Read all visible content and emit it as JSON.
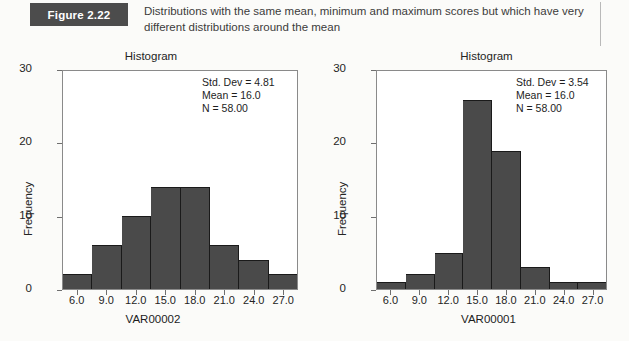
{
  "figure": {
    "badge": "Figure 2.22",
    "caption": "Distributions with the same mean, minimum and maximum scores but which have very different distributions around the mean"
  },
  "colors": {
    "bar_fill": "#4a4a4a",
    "bar_outline": "#1a1a1a",
    "badge_background": "#4c4c4c",
    "axis": "#8a8a8a",
    "page_background": "#fbfbf9"
  },
  "charts": [
    {
      "panel": "left",
      "title": "Histogram",
      "stats": {
        "std_dev": "Std. Dev = 4.81",
        "mean": "Mean = 16.0",
        "n": "N = 58.00"
      },
      "y_ticks": [
        "0",
        "10",
        "20",
        "30"
      ],
      "x_ticks": [
        "6.0",
        "9.0",
        "12.0",
        "15.0",
        "18.0",
        "21.0",
        "24.0",
        "27.0"
      ],
      "x_label": "VAR00002",
      "y_label": "Frequency"
    },
    {
      "panel": "right",
      "title": "Histogram",
      "stats": {
        "std_dev": "Std. Dev = 3.54",
        "mean": "Mean = 16.0",
        "n": "N = 58.00"
      },
      "y_ticks": [
        "0",
        "10",
        "20",
        "30"
      ],
      "x_ticks": [
        "6.0",
        "9.0",
        "12.0",
        "15.0",
        "18.0",
        "21.0",
        "24.0",
        "27.0"
      ],
      "x_label": "VAR00001",
      "y_label": "Frequency"
    }
  ],
  "chart_data": [
    {
      "type": "bar",
      "title": "Histogram",
      "xlabel": "VAR00002",
      "ylabel": "Frequency",
      "categories": [
        "6.0",
        "9.0",
        "12.0",
        "15.0",
        "18.0",
        "21.0",
        "24.0",
        "27.0"
      ],
      "values": [
        2,
        6,
        10,
        14,
        14,
        6,
        4,
        2
      ],
      "ylim": [
        0,
        30
      ],
      "yticks": [
        0,
        10,
        20,
        30
      ],
      "grid": false,
      "legend": "none",
      "annotations": [
        "Std. Dev = 4.81",
        "Mean = 16.0",
        "N = 58.00"
      ]
    },
    {
      "type": "bar",
      "title": "Histogram",
      "xlabel": "VAR00001",
      "ylabel": "Frequency",
      "categories": [
        "6.0",
        "9.0",
        "12.0",
        "15.0",
        "18.0",
        "21.0",
        "24.0",
        "27.0"
      ],
      "values": [
        1,
        2,
        5,
        26,
        19,
        3,
        1,
        1
      ],
      "ylim": [
        0,
        30
      ],
      "yticks": [
        0,
        10,
        20,
        30
      ],
      "grid": false,
      "legend": "none",
      "annotations": [
        "Std. Dev = 3.54",
        "Mean = 16.0",
        "N = 58.00"
      ]
    }
  ]
}
